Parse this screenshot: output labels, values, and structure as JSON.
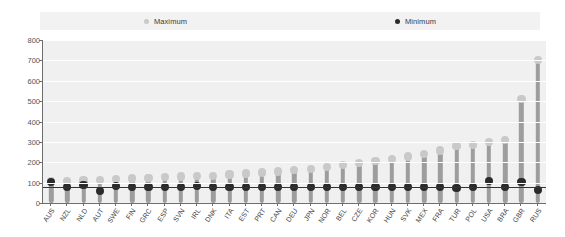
{
  "legend": {
    "items": [
      {
        "label": "Maximum",
        "color": "#c9c9c9"
      },
      {
        "label": "Minimum",
        "color": "#2b2b2b"
      }
    ],
    "position": "top"
  },
  "axis": {
    "y_ticks": [
      "800",
      "700",
      "600",
      "500",
      "400",
      "300",
      "200",
      "100",
      "0"
    ]
  },
  "chart_data": {
    "type": "bar",
    "title": "",
    "subtitle": "",
    "xlabel": "",
    "ylabel": "",
    "ylim": [
      0,
      800
    ],
    "ytick_step": 100,
    "grid": true,
    "legend_position": "top",
    "categories": [
      "AUS",
      "NZL",
      "NLD",
      "AUT",
      "SWE",
      "FIN",
      "GRC",
      "ESP",
      "SVN",
      "IRL",
      "DNK",
      "ITA",
      "EST",
      "PRT",
      "CAN",
      "DEU",
      "JPN",
      "NOR",
      "BEL",
      "CZE",
      "KOR",
      "HUN",
      "SVK",
      "MEX",
      "FRA",
      "TUR",
      "POL",
      "USA",
      "BRA",
      "GBR",
      "RUS"
    ],
    "series": [
      {
        "name": "Maximum",
        "color": "#c9c9c9",
        "values": [
          108,
          108,
          110,
          112,
          118,
          120,
          122,
          126,
          130,
          132,
          134,
          140,
          145,
          150,
          155,
          160,
          168,
          175,
          185,
          195,
          205,
          215,
          228,
          240,
          258,
          278,
          285,
          300,
          310,
          510,
          700
        ]
      },
      {
        "name": "Minimum",
        "color": "#2b2b2b",
        "values": [
          105,
          78,
          88,
          60,
          85,
          80,
          80,
          78,
          80,
          82,
          80,
          80,
          80,
          80,
          80,
          80,
          80,
          80,
          80,
          78,
          78,
          78,
          78,
          78,
          78,
          72,
          80,
          108,
          78,
          102,
          62
        ]
      }
    ]
  }
}
